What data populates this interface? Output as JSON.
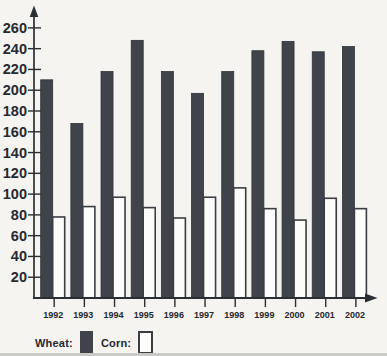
{
  "chart_data": {
    "type": "bar",
    "categories": [
      "1992",
      "1993",
      "1994",
      "1995",
      "1996",
      "1997",
      "1998",
      "1999",
      "2000",
      "2001",
      "2002"
    ],
    "series": [
      {
        "name": "Wheat",
        "legend_label": "Wheat:",
        "style": "filled",
        "fill": "#40444a",
        "stroke": "#2e3236",
        "values": [
          210,
          168,
          218,
          248,
          218,
          197,
          218,
          238,
          247,
          237,
          242
        ]
      },
      {
        "name": "Corn",
        "legend_label": "Corn:",
        "style": "outline",
        "fill": "#fcfcfa",
        "stroke": "#3b3f44",
        "values": [
          78,
          88,
          97,
          87,
          77,
          97,
          106,
          86,
          75,
          96,
          86
        ]
      }
    ],
    "yticks": [
      20,
      40,
      60,
      80,
      100,
      120,
      140,
      160,
      180,
      200,
      220,
      240,
      260
    ],
    "ylim": [
      0,
      273
    ],
    "grid": false,
    "legend_position": "bottom-left",
    "axis_color": "#2b2f33",
    "text_color": "#26292e"
  }
}
